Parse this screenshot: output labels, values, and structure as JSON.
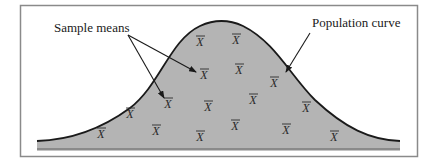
{
  "diagram": {
    "colors": {
      "frame": "#8a8a8a",
      "fill": "#b4b4b4",
      "curve": "#1a1a1a",
      "text": "#1a1a1a",
      "background": "#ffffff"
    },
    "labels": {
      "sample_means": "Sample means",
      "population_curve": "Population curve"
    },
    "marker_symbol": "X",
    "markers": [
      {
        "x": 200,
        "y": 46
      },
      {
        "x": 236,
        "y": 44
      },
      {
        "x": 204,
        "y": 79
      },
      {
        "x": 239,
        "y": 74
      },
      {
        "x": 274,
        "y": 87
      },
      {
        "x": 168,
        "y": 108
      },
      {
        "x": 208,
        "y": 111
      },
      {
        "x": 253,
        "y": 104
      },
      {
        "x": 306,
        "y": 112
      },
      {
        "x": 130,
        "y": 118
      },
      {
        "x": 156,
        "y": 135
      },
      {
        "x": 200,
        "y": 141
      },
      {
        "x": 235,
        "y": 130
      },
      {
        "x": 286,
        "y": 134
      },
      {
        "x": 334,
        "y": 141
      },
      {
        "x": 101,
        "y": 138
      }
    ]
  }
}
